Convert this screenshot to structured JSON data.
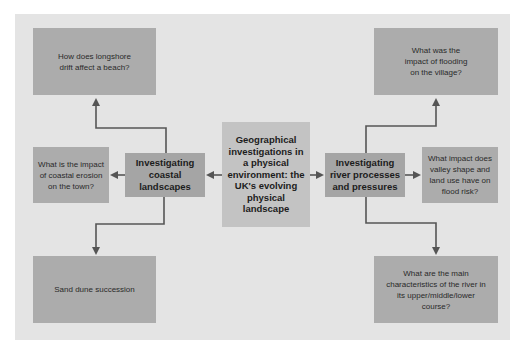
{
  "diagram": {
    "center": {
      "label": "Geographical investigations in a physical environment: the UK's evolving physical landscape"
    },
    "branches": [
      {
        "label": "Investigating coastal landscapes",
        "questions": [
          "How does longshore drift affect a beach?",
          "What is the impact of coastal erosion on the town?",
          "Sand dune succession"
        ]
      },
      {
        "label": "Investigating river processes and pressures",
        "questions": [
          "What was the impact of flooding on the village?",
          "What impact does valley shape and land use have on flood risk?",
          "What are the main characteristics of the river in its upper/middle/lower course?"
        ]
      }
    ],
    "colors": {
      "background": "#ffffff",
      "panel": "#e4e4e4",
      "question_box": "#acacac",
      "branch_box": "#a5a5a5",
      "center_box": "#c3c3c3",
      "arrow": "#555555"
    }
  }
}
